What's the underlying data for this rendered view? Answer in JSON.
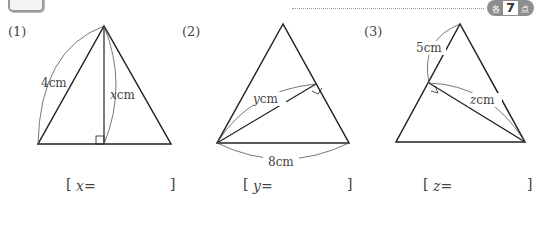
{
  "header": {
    "problem_number": "4",
    "points_badge": {
      "prefix": "各",
      "value": "7",
      "suffix": "点"
    }
  },
  "problems": [
    {
      "label": "(1)",
      "side_label": "4cm",
      "unknown_label": "xcm",
      "unknown_var": "x",
      "unknown_unit": "cm",
      "answer_prefix": "x="
    },
    {
      "label": "(2)",
      "side_label": "8cm",
      "unknown_label": "ycm",
      "unknown_var": "y",
      "unknown_unit": "cm",
      "answer_prefix": "y="
    },
    {
      "label": "(3)",
      "side_label": "5cm",
      "unknown_label": "zcm",
      "unknown_var": "z",
      "unknown_unit": "cm",
      "answer_prefix": "z="
    }
  ],
  "brackets": {
    "open": "[",
    "close": "]"
  }
}
